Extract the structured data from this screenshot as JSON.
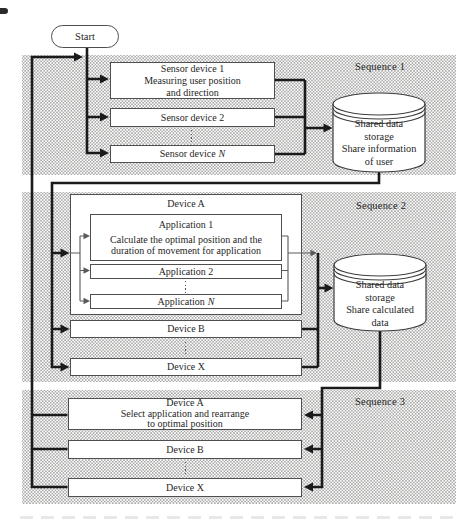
{
  "colors": {
    "ink": "#1a1a1a",
    "box_border": "#4f4f4f",
    "halftone_dot": "#ababab"
  },
  "figure": {
    "start": "Start",
    "sequence_labels": [
      "Sequence 1",
      "Sequence 2",
      "Sequence 3"
    ],
    "sequence1": {
      "sensor_device_1": "Sensor device 1\nMeasuring user position\nand direction",
      "sensor_device_2": "Sensor device 2",
      "sensor_device_n_prefix": "Sensor device",
      "sensor_device_n_var": "N",
      "storage": "Shared data\nstorage\nShare information\nof user"
    },
    "sequence2": {
      "device_a": "Device A",
      "application_1_title": "Application 1",
      "application_1_body": "Calculate the optimal position and the\nduration of movement for application",
      "application_2": "Application 2",
      "application_n_prefix": "Application",
      "application_n_var": "N",
      "device_b": "Device B",
      "device_x": "Device X",
      "storage": "Shared data\nstorage\nShare calculated\ndata"
    },
    "sequence3": {
      "device_a": "Device A\nSelect application and rearrange\nto optimal position",
      "device_b": "Device B",
      "device_x": "Device X"
    }
  }
}
